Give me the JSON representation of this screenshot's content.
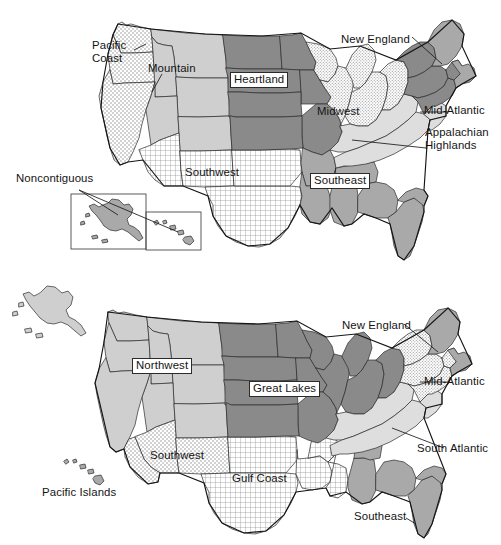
{
  "figure": {
    "title": "",
    "type": "choropleth-region-map-pair",
    "background_color": "#ffffff",
    "text_color": "#141414"
  },
  "palette": {
    "dark_gray": "#8a8a8a",
    "mid_gray": "#a9a9a9",
    "light_gray": "#cfcfcf",
    "pale_gray": "#dedede",
    "white": "#ffffff",
    "outline": "#141414",
    "state_line": "#2b2b2b"
  },
  "maps": [
    {
      "id": "map-top",
      "name": "nine-region-scheme",
      "regions": [
        {
          "key": "pacific-coast",
          "label": "Pacific Coast",
          "fill": "dotted-light",
          "label_style": "plain-two-line",
          "leader": true
        },
        {
          "key": "mountain",
          "label": "Mountain",
          "fill": "light-gray",
          "label_style": "plain",
          "leader": true
        },
        {
          "key": "noncontiguous",
          "label": "Noncontiguous",
          "fill": "mid-gray",
          "label_style": "plain",
          "leader": true
        },
        {
          "key": "southwest",
          "label": "Southwest",
          "fill": "crosshatch",
          "label_style": "plain",
          "leader": false
        },
        {
          "key": "heartland",
          "label": "Heartland",
          "fill": "dark-gray",
          "label_style": "boxed",
          "leader": false
        },
        {
          "key": "midwest",
          "label": "Midwest",
          "fill": "dotted-fine",
          "label_style": "plain",
          "leader": false
        },
        {
          "key": "southeast",
          "label": "Southeast",
          "fill": "mid-gray",
          "label_style": "boxed",
          "leader": false
        },
        {
          "key": "appalachian-highlands",
          "label": "Appalachian Highlands",
          "fill": "pale-gray",
          "label_style": "plain-two-line",
          "leader": true
        },
        {
          "key": "mid-atlantic",
          "label": "Mid-Atlantic",
          "fill": "dark-gray",
          "label_style": "plain",
          "leader": true
        },
        {
          "key": "new-england",
          "label": "New England",
          "fill": "mid-gray",
          "label_style": "plain",
          "leader": true
        }
      ],
      "insets": [
        {
          "key": "alaska-inset",
          "label": "Alaska"
        },
        {
          "key": "hawaii-inset",
          "label": "Hawaii"
        }
      ]
    },
    {
      "id": "map-bottom",
      "name": "eight-region-scheme",
      "regions": [
        {
          "key": "pacific-islands",
          "label": "Pacific Islands",
          "fill": "mid-gray",
          "label_style": "plain",
          "leader": false
        },
        {
          "key": "northwest",
          "label": "Northwest",
          "fill": "light-gray",
          "label_style": "boxed",
          "leader": false
        },
        {
          "key": "southwest",
          "label": "Southwest",
          "fill": "dotted-light",
          "label_style": "plain",
          "leader": false
        },
        {
          "key": "great-lakes",
          "label": "Great Lakes",
          "fill": "dark-gray",
          "label_style": "boxed",
          "leader": false
        },
        {
          "key": "gulf-coast",
          "label": "Gulf Coast",
          "fill": "crosshatch",
          "label_style": "plain",
          "leader": false
        },
        {
          "key": "new-england",
          "label": "New England",
          "fill": "mid-gray",
          "label_style": "plain",
          "leader": true
        },
        {
          "key": "mid-atlantic",
          "label": "Mid-Atlantic",
          "fill": "dotted-fine",
          "label_style": "plain",
          "leader": true
        },
        {
          "key": "south-atlantic",
          "label": "South Atlantic",
          "fill": "pale-gray",
          "label_style": "plain",
          "leader": true
        },
        {
          "key": "southeast",
          "label": "Southeast",
          "fill": "mid-gray",
          "label_style": "plain",
          "leader": true
        }
      ],
      "insets": []
    }
  ],
  "labels_top": {
    "pacific_coast_l1": "Pacific",
    "pacific_coast_l2": "Coast",
    "mountain": "Mountain",
    "noncontiguous": "Noncontiguous",
    "southwest": "Southwest",
    "heartland": "Heartland",
    "midwest": "Midwest",
    "southeast": "Southeast",
    "appalachian_l1": "Appalachian",
    "appalachian_l2": "Highlands",
    "mid_atlantic": "Mid-Atlantic",
    "new_england": "New England"
  },
  "labels_bottom": {
    "pacific_islands": "Pacific Islands",
    "northwest": "Northwest",
    "southwest": "Southwest",
    "great_lakes": "Great Lakes",
    "gulf_coast": "Gulf Coast",
    "new_england": "New England",
    "mid_atlantic": "Mid-Atlantic",
    "south_atlantic": "South Atlantic",
    "southeast": "Southeast"
  }
}
